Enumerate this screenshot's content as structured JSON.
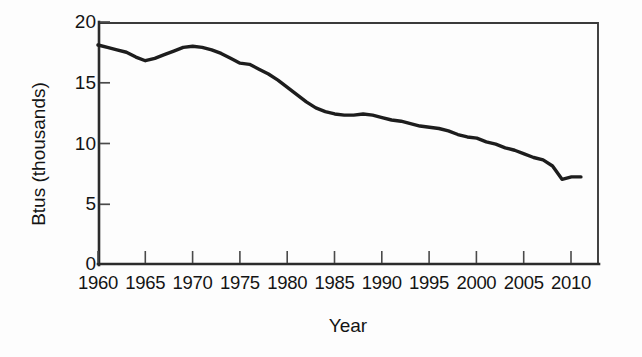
{
  "chart_data": {
    "type": "line",
    "title": "",
    "xlabel": "Year",
    "ylabel": "Btus (thousands)",
    "xlim": [
      1960,
      2012.8
    ],
    "ylim": [
      0,
      20
    ],
    "grid": false,
    "legend": null,
    "y_ticks": [
      0,
      5,
      10,
      15,
      20
    ],
    "y_tick_labels": [
      "0",
      "5",
      "10",
      "15",
      "20"
    ],
    "x_ticks": [
      1960,
      1965,
      1970,
      1975,
      1980,
      1985,
      1990,
      1995,
      2000,
      2005,
      2010
    ],
    "x_tick_labels": [
      "1960",
      "1965",
      "1970",
      "1975",
      "1980",
      "1985",
      "1990",
      "1995",
      "2000",
      "2005",
      "2010"
    ],
    "series": [
      {
        "name": "Btus (thousands)",
        "color": "#1d1d1d",
        "x": [
          1960,
          1961,
          1962,
          1963,
          1964,
          1965,
          1966,
          1967,
          1968,
          1969,
          1970,
          1971,
          1972,
          1973,
          1974,
          1975,
          1976,
          1977,
          1978,
          1979,
          1980,
          1981,
          1982,
          1983,
          1984,
          1985,
          1986,
          1987,
          1988,
          1989,
          1990,
          1991,
          1992,
          1993,
          1994,
          1995,
          1996,
          1997,
          1998,
          1999,
          2000,
          2001,
          2002,
          2003,
          2004,
          2005,
          2006,
          2007,
          2008,
          2009,
          2010,
          2011
        ],
        "y": [
          18.1,
          17.9,
          17.7,
          17.5,
          17.1,
          16.8,
          17.0,
          17.3,
          17.6,
          17.9,
          18.0,
          17.9,
          17.7,
          17.4,
          17.0,
          16.6,
          16.5,
          16.1,
          15.7,
          15.2,
          14.6,
          14.0,
          13.4,
          12.9,
          12.6,
          12.4,
          12.3,
          12.3,
          12.4,
          12.3,
          12.1,
          11.9,
          11.8,
          11.6,
          11.4,
          11.3,
          11.2,
          11.0,
          10.7,
          10.5,
          10.4,
          10.1,
          9.9,
          9.6,
          9.4,
          9.1,
          8.8,
          8.6,
          8.1,
          7.0,
          7.2,
          7.2
        ],
        "start_value": 18.1,
        "end_value": 7.2,
        "peak_value": 18.1,
        "peak_year": 1960,
        "min_value": 7.0,
        "min_year": 2009
      }
    ]
  },
  "figure": {
    "y_axis_title": "Btus (thousands)",
    "x_axis_title": "Year",
    "y_tick_labels": [
      "20",
      "15",
      "10",
      "5",
      "0"
    ],
    "x_tick_labels": [
      "1960",
      "1965",
      "1970",
      "1975",
      "1980",
      "1985",
      "1990",
      "1995",
      "2000",
      "2005",
      "2010"
    ],
    "line_color": "#1d1d1d",
    "axis_color": "#2b2b2b",
    "background_color": "#fdfdfd"
  }
}
